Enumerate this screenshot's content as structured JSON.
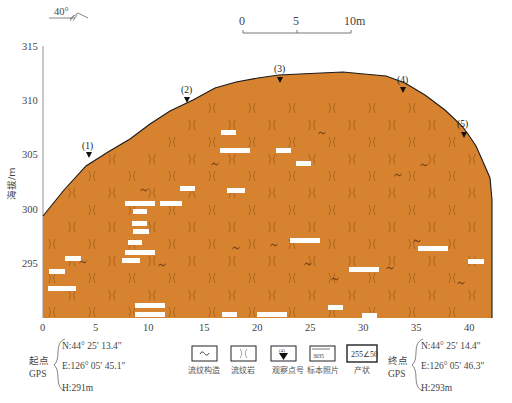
{
  "figure": {
    "orientation_label": "40°",
    "scale_bar": {
      "ticks": [
        "0",
        "5",
        "10m"
      ]
    },
    "y_axis": {
      "label": "海拔/m",
      "ticks": [
        "315",
        "310",
        "305",
        "300",
        "295"
      ]
    },
    "x_axis": {
      "ticks": [
        "0",
        "5",
        "10",
        "15",
        "20",
        "25",
        "30",
        "35",
        "40"
      ]
    },
    "markers": [
      {
        "label": "(1)",
        "x_m": 4.3,
        "elev": 304.6
      },
      {
        "label": "(2)",
        "x_m": 13.6,
        "elev": 310.1
      },
      {
        "label": "(3)",
        "x_m": 22.3,
        "elev": 311.9
      },
      {
        "label": "(4)",
        "x_m": 34.0,
        "elev": 310.7
      },
      {
        "label": "(5)",
        "x_m": 39.4,
        "elev": 306.8
      }
    ],
    "rock_fill_color": "#d7822e",
    "outline_color": "#1a1a1a"
  },
  "legend": {
    "items": [
      {
        "icon": "flow-structure-icon",
        "caption": "流纹构造"
      },
      {
        "icon": "rhyolite-icon",
        "caption": "流纹岩"
      },
      {
        "icon": "survey-point-icon",
        "caption": "观察点号",
        "icon_text": "(4)"
      },
      {
        "icon": "specimen-photo-icon",
        "caption": "标本照片",
        "icon_text": "3035"
      },
      {
        "icon": "attitude-icon",
        "caption": "产状",
        "icon_text": "255∠50"
      }
    ]
  },
  "gps_start": {
    "label_line1": "起点",
    "label_line2": "GPS",
    "n": "N:44°  25′  13.4″",
    "e": "E:126°  05′  45.1″",
    "h": "H:291m"
  },
  "gps_end": {
    "label_line1": "终点",
    "label_line2": "GPS",
    "n": "N:44°  25′  14.4″",
    "e": "E:126°  05′  46.3″",
    "h": "H:293m"
  },
  "chart_data": {
    "type": "cross-section profile",
    "title": "",
    "xlabel": "distance (m)",
    "ylabel": "海拔/m",
    "xlim": [
      0,
      42
    ],
    "ylim": [
      290,
      315
    ],
    "profile_x": [
      0,
      2,
      4,
      6,
      8,
      10,
      12,
      14,
      16,
      18,
      20,
      22,
      24,
      26,
      28,
      30,
      32,
      34,
      36,
      38,
      39.4,
      40.5,
      41.5,
      42
    ],
    "profile_elev": [
      299,
      301.4,
      303.9,
      305.5,
      306.8,
      308.0,
      309.3,
      310.4,
      311.1,
      311.5,
      311.8,
      311.9,
      311.9,
      312.0,
      311.8,
      311.7,
      311.3,
      310.7,
      309.5,
      308.0,
      306.8,
      305.5,
      303.8,
      301
    ]
  }
}
